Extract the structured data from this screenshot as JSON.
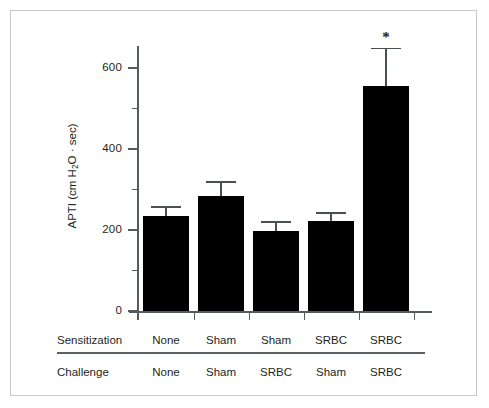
{
  "chart_data": {
    "type": "bar",
    "title": "",
    "xlabel": "",
    "ylabel": "APTI (cm H₂O · sec)",
    "ylim": [
      0,
      660
    ],
    "yticks_major": [
      0,
      200,
      400,
      600
    ],
    "yticks_minor": [
      100,
      300,
      500
    ],
    "ytick_labels": [
      "0",
      "200",
      "400",
      "600"
    ],
    "grid": false,
    "legend": "none",
    "bar_color": "#000000",
    "categories": [
      "None / None",
      "Sham / Sham",
      "Sham / SRBC",
      "SRBC / Sham",
      "SRBC / SRBC"
    ],
    "values": [
      235,
      284,
      198,
      222,
      556
    ],
    "errors": [
      24,
      37,
      24,
      22,
      94
    ],
    "error_type": "SEM (upper whisker only)",
    "annotations": [
      {
        "category": "SRBC / SRBC",
        "text": "*",
        "meaning": "significant"
      }
    ]
  },
  "axis": {
    "y_title": "APTI (cm H",
    "y_title_sub": "2",
    "y_title_rest": "O · sec)",
    "tick_labels": {
      "t0": "0",
      "t200": "200",
      "t400": "400",
      "t600": "600"
    }
  },
  "table": {
    "rows": [
      {
        "label": "Sensitization",
        "cells": [
          "None",
          "Sham",
          "Sham",
          "SRBC",
          "SRBC"
        ]
      },
      {
        "label": "Challenge",
        "cells": [
          "None",
          "Sham",
          "SRBC",
          "Sham",
          "SRBC"
        ]
      }
    ]
  },
  "marks": {
    "asterisk": "*"
  },
  "colors": {
    "bar": "#000000",
    "axis": "#555b5e",
    "text": "#231f20",
    "frame": "#c8c8c8",
    "background": "#ffffff"
  }
}
